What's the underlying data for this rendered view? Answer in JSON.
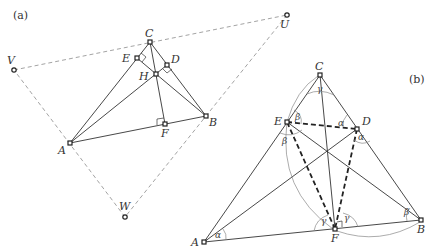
{
  "panel_a": {
    "tag": "(a)",
    "points": {
      "A": {
        "label": "A",
        "x": 70,
        "y": 143
      },
      "B": {
        "label": "B",
        "x": 206,
        "y": 116
      },
      "C": {
        "label": "C",
        "x": 150,
        "y": 42
      },
      "D": {
        "label": "D",
        "x": 167,
        "y": 65
      },
      "E": {
        "label": "E",
        "x": 137,
        "y": 58
      },
      "F": {
        "label": "F",
        "x": 165,
        "y": 124
      },
      "H": {
        "label": "H",
        "x": 156,
        "y": 74
      },
      "U": {
        "label": "U",
        "x": 287,
        "y": 15
      },
      "V": {
        "label": "V",
        "x": 14,
        "y": 70
      },
      "W": {
        "label": "W",
        "x": 125,
        "y": 217
      }
    }
  },
  "panel_b": {
    "tag": "(b)",
    "points": {
      "A": {
        "label": "A",
        "x": 204,
        "y": 242
      },
      "B": {
        "label": "B",
        "x": 421,
        "y": 220
      },
      "C": {
        "label": "C",
        "x": 320,
        "y": 75
      },
      "D": {
        "label": "D",
        "x": 357,
        "y": 129
      },
      "E": {
        "label": "E",
        "x": 287,
        "y": 122
      },
      "F": {
        "label": "F",
        "x": 335,
        "y": 229
      }
    },
    "angles": {
      "alpha": "α",
      "beta": "β",
      "gamma": "γ"
    }
  }
}
